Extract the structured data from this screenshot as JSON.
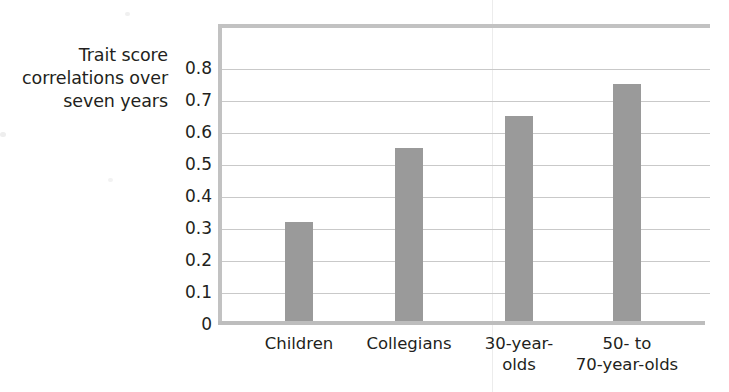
{
  "chart_data": {
    "type": "bar",
    "title": "",
    "subtitle": "",
    "xlabel": "",
    "ylabel": "Trait score correlations over seven years",
    "ylabel_lines": [
      "Trait score",
      "correlations over",
      "seven years"
    ],
    "categories": [
      "Children",
      "Collegians",
      "30-year-olds",
      "50- to 70-year-olds"
    ],
    "category_lines": [
      [
        "Children"
      ],
      [
        "Collegians"
      ],
      [
        "30-year-",
        "olds"
      ],
      [
        "50-  to",
        "70-year-olds"
      ]
    ],
    "values": [
      0.31,
      0.54,
      0.64,
      0.74
    ],
    "ylim": [
      0,
      0.9
    ],
    "yticks": [
      0.8,
      0.7,
      0.6,
      0.5,
      0.4,
      0.3,
      0.2,
      0.1,
      0
    ],
    "ytick_labels": [
      "0.8",
      "0.7",
      "0.6",
      "0.5",
      "0.4",
      "0.3",
      "0.2",
      "0.1",
      "0"
    ],
    "grid": true,
    "grid_axis": "y",
    "legend": null,
    "colors": {
      "bar": "#9a9a9a",
      "gridline": "#c9c9c9",
      "frame": "#c2c2c2",
      "text": "#231f20",
      "background": "#ffffff"
    }
  }
}
